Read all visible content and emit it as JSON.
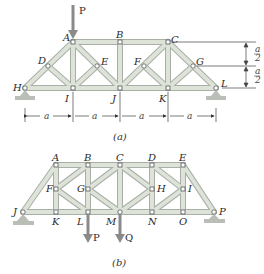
{
  "figure_a": {
    "caption": "(a)",
    "load_label": "P",
    "nodes": {
      "A": "A",
      "B": "B",
      "C": "C",
      "D": "D",
      "E": "E",
      "F": "F",
      "G": "G",
      "H": "H",
      "I": "I",
      "J": "J",
      "K": "K",
      "L": "L"
    },
    "span_dims": [
      "a",
      "a",
      "a",
      "a"
    ],
    "height_dims": [
      "a/2",
      "a/2"
    ],
    "height_dims_num": "a",
    "height_dims_den": "2"
  },
  "figure_b": {
    "caption": "(b)",
    "load_labels": [
      "P",
      "Q"
    ],
    "nodes": {
      "A": "A",
      "B": "B",
      "C": "C",
      "D": "D",
      "E": "E",
      "F": "F",
      "G": "G",
      "H": "H",
      "I": "I",
      "J": "J",
      "K": "K",
      "L": "L",
      "M": "M",
      "N": "N",
      "O": "O",
      "P": "P"
    }
  },
  "colors": {
    "member_fill": "#dde3d9",
    "member_edge": "#a8b0a5",
    "support": "#b9bfb6",
    "arrow": "#8a8a8a"
  }
}
